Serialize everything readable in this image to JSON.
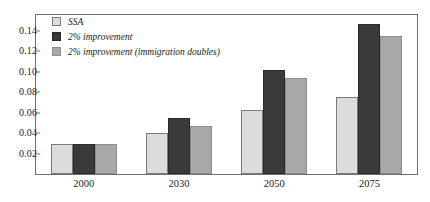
{
  "chart_data": {
    "type": "bar",
    "title": "",
    "subtitle": "",
    "xlabel": "",
    "ylabel": "",
    "categories": [
      "2000",
      "2030",
      "2050",
      "2075"
    ],
    "series": [
      {
        "name": "SSA",
        "color": "#dcdcdc",
        "values": [
          0.029,
          0.04,
          0.063,
          0.075
        ]
      },
      {
        "name": "2% improvement",
        "color": "#3a3a3a",
        "values": [
          0.029,
          0.055,
          0.102,
          0.147
        ]
      },
      {
        "name": "2% improvement (immigration doubles)",
        "color": "#a8a8a8",
        "values": [
          0.029,
          0.047,
          0.094,
          0.135
        ]
      }
    ],
    "ylim": [
      0.0,
      0.1556
    ],
    "yticks": [
      0.02,
      0.04,
      0.06,
      0.08,
      0.1,
      0.12,
      0.14
    ],
    "ytick_labels": [
      "0.02",
      "0.04",
      "0.06",
      "0.08",
      "0.10",
      "0.12",
      "0.14"
    ],
    "grid": false,
    "legend_position": "top-left",
    "frame_color": "#6f6f6f",
    "background": "#ffffff"
  }
}
